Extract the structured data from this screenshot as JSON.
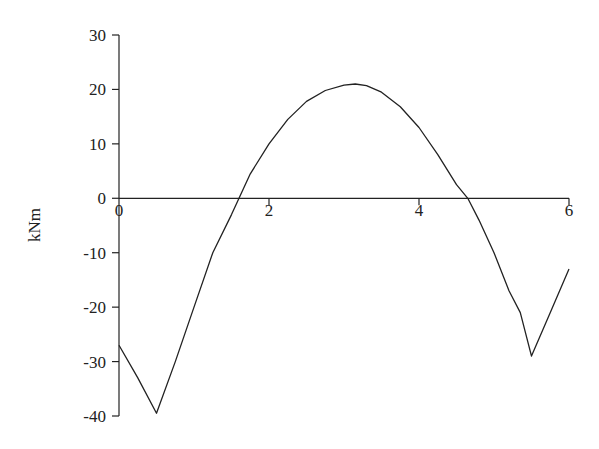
{
  "chart_data": {
    "type": "line",
    "title": "",
    "xlabel": "",
    "ylabel": "kNm",
    "xlim": [
      0,
      6
    ],
    "ylim": [
      -40,
      30
    ],
    "x_ticks": [
      0,
      2,
      4,
      6
    ],
    "y_ticks": [
      30,
      20,
      10,
      0,
      -10,
      -20,
      -30,
      -40
    ],
    "grid": false,
    "legend": null,
    "series": [
      {
        "name": "Bending moment",
        "color": "#222222",
        "x": [
          0,
          0.25,
          0.5,
          0.75,
          1.0,
          1.25,
          1.5,
          1.6,
          1.75,
          2.0,
          2.25,
          2.5,
          2.75,
          3.0,
          3.15,
          3.3,
          3.5,
          3.75,
          4.0,
          4.25,
          4.5,
          4.65,
          4.8,
          5.0,
          5.2,
          5.35,
          5.5,
          5.75,
          6.0
        ],
        "y": [
          -27,
          -33,
          -39.5,
          -30,
          -20,
          -10,
          -3,
          0,
          4.5,
          10,
          14.5,
          17.8,
          19.8,
          20.8,
          21,
          20.7,
          19.5,
          16.8,
          13,
          8,
          2.5,
          0,
          -4,
          -10,
          -17,
          -21,
          -29,
          -21,
          -13
        ]
      }
    ]
  },
  "axes": {
    "ylabel": "kNm",
    "x_tick_labels": [
      "0",
      "2",
      "4",
      "6"
    ],
    "y_tick_labels": [
      "30",
      "20",
      "10",
      "0",
      "-10",
      "-20",
      "-30",
      "-40"
    ]
  }
}
